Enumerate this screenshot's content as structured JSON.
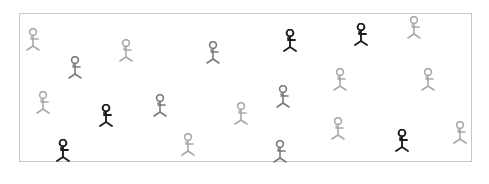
{
  "scene": {
    "description": "Stick figures scattered inside a bordered rectangle",
    "frame": {
      "x": 19,
      "y": 13,
      "width": 453,
      "height": 149,
      "border_color": "#c8c8c8"
    },
    "shades": {
      "dark": "#1e1e1e",
      "mid": "#7a7a7a",
      "light": "#a9a9a9"
    },
    "figures": [
      {
        "x": 33,
        "y": 32,
        "shade": "light"
      },
      {
        "x": 75,
        "y": 60,
        "shade": "mid"
      },
      {
        "x": 126,
        "y": 43,
        "shade": "light"
      },
      {
        "x": 213,
        "y": 45,
        "shade": "mid"
      },
      {
        "x": 290,
        "y": 33,
        "shade": "dark"
      },
      {
        "x": 361,
        "y": 27,
        "shade": "dark"
      },
      {
        "x": 414,
        "y": 20,
        "shade": "light"
      },
      {
        "x": 43,
        "y": 95,
        "shade": "light"
      },
      {
        "x": 106,
        "y": 108,
        "shade": "dark"
      },
      {
        "x": 160,
        "y": 98,
        "shade": "mid"
      },
      {
        "x": 241,
        "y": 106,
        "shade": "light"
      },
      {
        "x": 283,
        "y": 89,
        "shade": "mid"
      },
      {
        "x": 340,
        "y": 72,
        "shade": "light"
      },
      {
        "x": 428,
        "y": 72,
        "shade": "light"
      },
      {
        "x": 63,
        "y": 143,
        "shade": "dark"
      },
      {
        "x": 188,
        "y": 137,
        "shade": "light"
      },
      {
        "x": 280,
        "y": 144,
        "shade": "mid"
      },
      {
        "x": 338,
        "y": 121,
        "shade": "light"
      },
      {
        "x": 402,
        "y": 133,
        "shade": "dark"
      },
      {
        "x": 460,
        "y": 125,
        "shade": "light"
      }
    ]
  }
}
